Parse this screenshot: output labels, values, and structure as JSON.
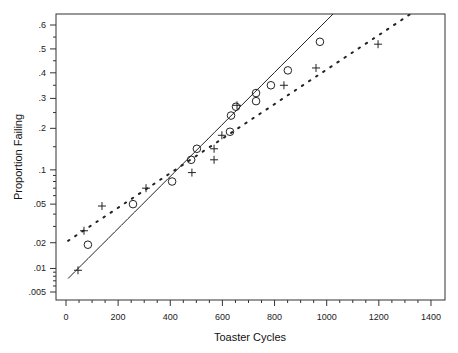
{
  "chart_data": {
    "type": "scatter",
    "title": "",
    "xlabel": "Toaster Cycles",
    "ylabel": "Proportion Failing",
    "xlim": [
      -60,
      1470
    ],
    "ylim": [
      0.004,
      0.65
    ],
    "y_scale": "probability",
    "grid": false,
    "legend": null,
    "x_ticks": [
      0,
      200,
      400,
      600,
      800,
      1000,
      1200,
      1400
    ],
    "y_ticks": [
      {
        "value": 0.6,
        "label": ".6"
      },
      {
        "value": 0.5,
        "label": ".5"
      },
      {
        "value": 0.4,
        "label": ".4"
      },
      {
        "value": 0.3,
        "label": ".3"
      },
      {
        "value": 0.2,
        "label": ".2"
      },
      {
        "value": 0.1,
        "label": ".1"
      },
      {
        "value": 0.05,
        "label": ".05"
      },
      {
        "value": 0.02,
        "label": ".02"
      },
      {
        "value": 0.01,
        "label": ".01"
      },
      {
        "value": 0.005,
        "label": ".005"
      }
    ],
    "series": [
      {
        "name": "circles",
        "marker": "circle",
        "points": [
          [
            84,
            0.019
          ],
          [
            257,
            0.05
          ],
          [
            407,
            0.08
          ],
          [
            480,
            0.12
          ],
          [
            502,
            0.145
          ],
          [
            629,
            0.19
          ],
          [
            633,
            0.24
          ],
          [
            652,
            0.27
          ],
          [
            729,
            0.29
          ],
          [
            729,
            0.32
          ],
          [
            786,
            0.35
          ],
          [
            851,
            0.41
          ],
          [
            974,
            0.53
          ]
        ]
      },
      {
        "name": "plus",
        "marker": "plus",
        "points": [
          [
            46,
            0.0095
          ],
          [
            69,
            0.027
          ],
          [
            138,
            0.048
          ],
          [
            307,
            0.07
          ],
          [
            483,
            0.095
          ],
          [
            568,
            0.12
          ],
          [
            568,
            0.145
          ],
          [
            598,
            0.18
          ],
          [
            656,
            0.275
          ],
          [
            836,
            0.35
          ],
          [
            959,
            0.42
          ],
          [
            1197,
            0.52
          ]
        ]
      },
      {
        "name": "solid fit",
        "line": "solid",
        "points": [
          [
            8,
            0.0075
          ],
          [
            1030,
            0.65
          ]
        ]
      },
      {
        "name": "dotted fit",
        "line": "dotted",
        "points": [
          [
            8,
            0.021
          ],
          [
            1330,
            0.65
          ]
        ]
      }
    ]
  }
}
